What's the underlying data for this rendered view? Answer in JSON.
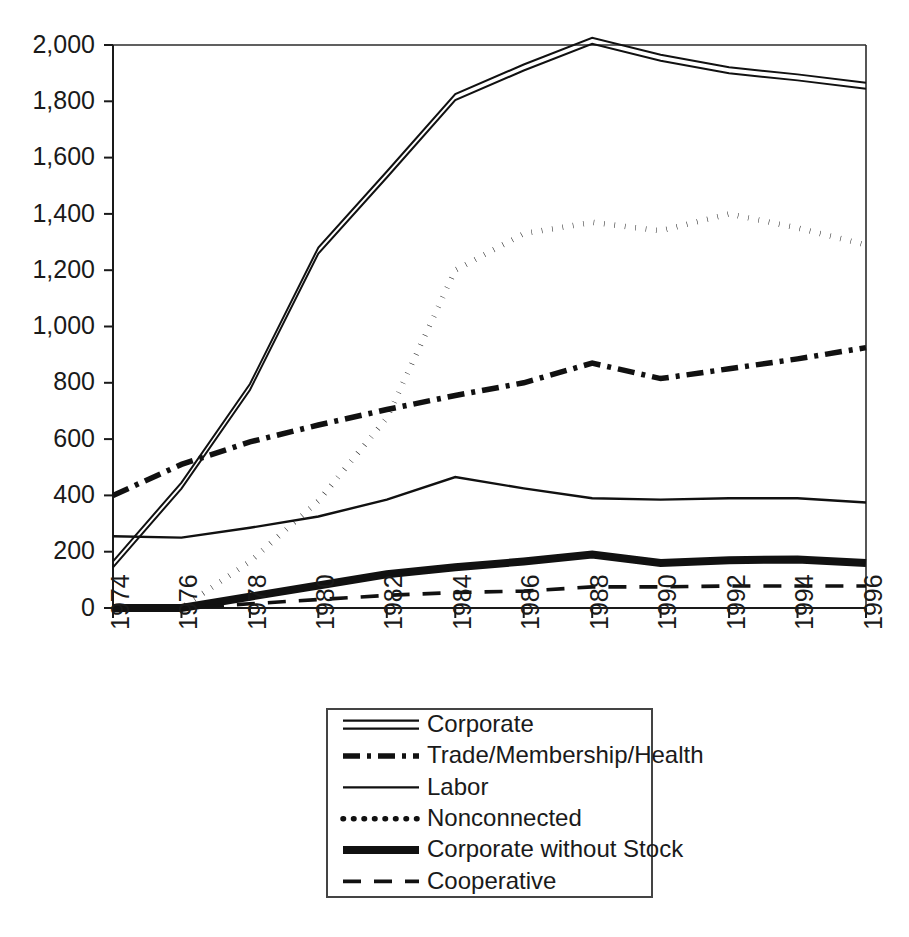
{
  "chart_data": {
    "type": "line",
    "title": "",
    "xlabel": "",
    "ylabel": "",
    "x": [
      1974,
      1976,
      1978,
      1980,
      1982,
      1984,
      1986,
      1988,
      1990,
      1992,
      1994,
      1996
    ],
    "categories": [
      "1974",
      "1976",
      "1978",
      "1980",
      "1982",
      "1984",
      "1986",
      "1988",
      "1990",
      "1992",
      "1994",
      "1996"
    ],
    "xlim": [
      1974,
      1996
    ],
    "ylim": [
      0,
      2000
    ],
    "ytick_values": [
      0,
      200,
      400,
      600,
      800,
      1000,
      1200,
      1400,
      1600,
      1800,
      2000
    ],
    "ytick_labels": [
      "0",
      "200",
      "400",
      "600",
      "800",
      "1,000",
      "1,200",
      "1,400",
      "1,600",
      "1,800",
      "2,000"
    ],
    "grid": false,
    "legend_position": "bottom-center",
    "series": [
      {
        "name": "Corporate",
        "style": "double-line",
        "values": [
          155,
          435,
          785,
          1270,
          1540,
          1815,
          1920,
          2015,
          1955,
          1910,
          1885,
          1855
        ]
      },
      {
        "name": "Trade/Membership/Health",
        "style": "dash-dot",
        "values": [
          400,
          510,
          590,
          650,
          705,
          755,
          800,
          870,
          815,
          850,
          885,
          925
        ]
      },
      {
        "name": "Labor",
        "style": "thin-solid",
        "values": [
          255,
          250,
          285,
          325,
          385,
          465,
          425,
          390,
          385,
          390,
          390,
          375
        ]
      },
      {
        "name": "Nonconnected",
        "style": "dotted",
        "values": [
          0,
          0,
          165,
          380,
          675,
          1200,
          1330,
          1370,
          1340,
          1400,
          1350,
          1290
        ]
      },
      {
        "name": "Corporate without Stock",
        "style": "thick-solid",
        "values": [
          0,
          0,
          40,
          80,
          120,
          145,
          165,
          190,
          160,
          170,
          172,
          160
        ]
      },
      {
        "name": "Cooperative",
        "style": "dashed",
        "values": [
          0,
          0,
          15,
          30,
          45,
          55,
          60,
          75,
          75,
          78,
          78,
          78
        ]
      }
    ]
  },
  "legend": {
    "items": [
      {
        "label": "Corporate",
        "style": "double-line"
      },
      {
        "label": "Trade/Membership/Health",
        "style": "dash-dot"
      },
      {
        "label": "Labor",
        "style": "thin-solid"
      },
      {
        "label": "Nonconnected",
        "style": "dotted"
      },
      {
        "label": "Corporate without Stock",
        "style": "thick-solid"
      },
      {
        "label": "Cooperative",
        "style": "dashed"
      }
    ]
  },
  "colors": {
    "ink": "#111111",
    "axis": "#1a1a1a",
    "background": "#ffffff"
  }
}
